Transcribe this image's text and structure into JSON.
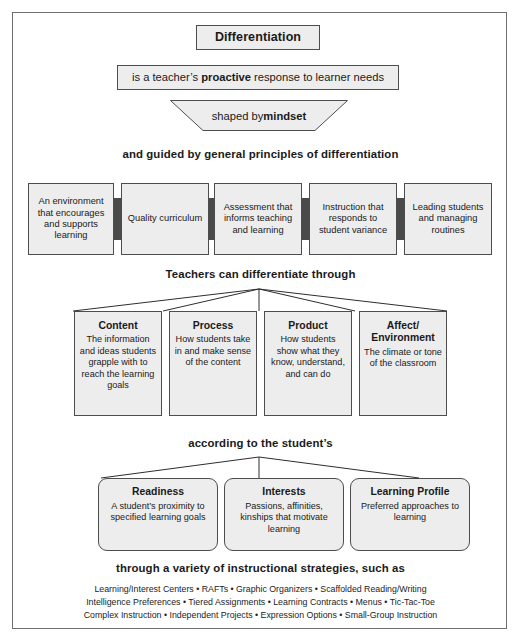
{
  "figure": {
    "border_color": "#6f6f6f",
    "box_fill": "#ededed",
    "box_border": "#4d4d4d",
    "connector_color": "#4a4a4a"
  },
  "title_box": {
    "label": "Differentiation"
  },
  "statement_box": {
    "prefix": "is a teacher’s ",
    "emphasis": "proactive",
    "suffix": " response to learner needs"
  },
  "trapezoid": {
    "prefix": "shaped by ",
    "emphasis": "mindset"
  },
  "headings": {
    "principles": "and guided by general principles of differentiation",
    "differentiate_through": "Teachers can differentiate through",
    "according_to": "according to the student’s",
    "strategies": "through a variety of instructional strategies, such as"
  },
  "principles": [
    {
      "label": "An environment that encourages and supports learning"
    },
    {
      "label": "Quality curriculum"
    },
    {
      "label": "Assessment that informs teaching and learning"
    },
    {
      "label": "Instruction that responds to student variance"
    },
    {
      "label": "Leading students and managing routines"
    }
  ],
  "categories": [
    {
      "title": "Content",
      "desc": "The information and ideas students grapple with to reach the learning goals"
    },
    {
      "title": "Process",
      "desc": "How students take in and make sense of the content"
    },
    {
      "title": "Product",
      "desc": "How students show what they know, understand, and can do"
    },
    {
      "title": "Affect/ Environment",
      "desc": "The climate or tone of the classroom"
    }
  ],
  "student_traits": [
    {
      "title": "Readiness",
      "desc": "A student’s proximity to specified learning goals"
    },
    {
      "title": "Interests",
      "desc": "Passions, affinities, kinships that motivate learning"
    },
    {
      "title": "Learning Profile",
      "desc": "Preferred approaches to learning"
    }
  ],
  "strategies_lines": [
    "Learning/Interest Centers  •  RAFTs  •  Graphic Organizers  •  Scaffolded Reading/Writing",
    "Intelligence Preferences  •  Tiered Assignments  •  Learning Contracts  •  Menus  •  Tic-Tac-Toe",
    "Complex Instruction  •  Independent Projects  •  Expression Options  •  Small-Group Instruction"
  ]
}
